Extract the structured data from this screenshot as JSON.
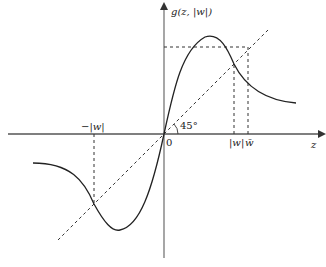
{
  "diagram": {
    "y_axis_label": "g(z, |w|)",
    "x_axis_label": "z",
    "origin_label": "0",
    "angle_label": "45°",
    "neg_w_label": "−|w|",
    "w_label": "|w|",
    "w_bar_label": "w̄",
    "colors": {
      "curve": "#222222",
      "axis": "#555555",
      "dashed": "#333333"
    }
  }
}
